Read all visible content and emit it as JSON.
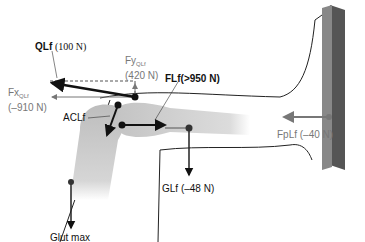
{
  "labels": {
    "qlf": {
      "name": "QLf",
      "value": "(100 N)"
    },
    "fy": {
      "name": "Fy",
      "sub": "QLf",
      "value": "(420 N)"
    },
    "fx": {
      "name": "Fx",
      "sub": "QLf",
      "value": "(–910 N)"
    },
    "flf": {
      "text": "FLf(>950 N)"
    },
    "aclf": {
      "text": "ACLf"
    },
    "glf": {
      "text": "GLf (–48 N)"
    },
    "fplf": {
      "text": "FpLf (–40 N)"
    },
    "glut": {
      "text": "Glut max"
    }
  },
  "colors": {
    "dark_arrow": "#111111",
    "gray_arrow": "#777777",
    "bone": "#c9c9c9",
    "plate": "#6e6e6e"
  }
}
